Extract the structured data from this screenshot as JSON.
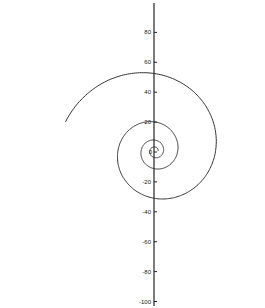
{
  "chart_data": {
    "type": "line",
    "title": "",
    "xlabel": "",
    "ylabel": "",
    "ylim": [
      -100,
      100
    ],
    "y_ticks": [
      80,
      60,
      40,
      20,
      0,
      -20,
      -40,
      -60,
      -80,
      -100
    ],
    "y_tick_labels": [
      "80",
      "60",
      "40",
      "20",
      "0",
      "-20",
      "-40",
      "-60",
      "-80",
      "-100"
    ],
    "grid": false,
    "legend": null,
    "series": [
      {
        "name": "spiral",
        "kind": "archimedean-like spiral",
        "center": [
          0,
          0
        ],
        "axis_crossings_y": [
          46,
          20,
          -30,
          -76
        ],
        "extent_right_x": [
          60,
          22
        ],
        "extent_left_x": [
          -37,
          -15
        ],
        "color": "#333333"
      }
    ]
  }
}
